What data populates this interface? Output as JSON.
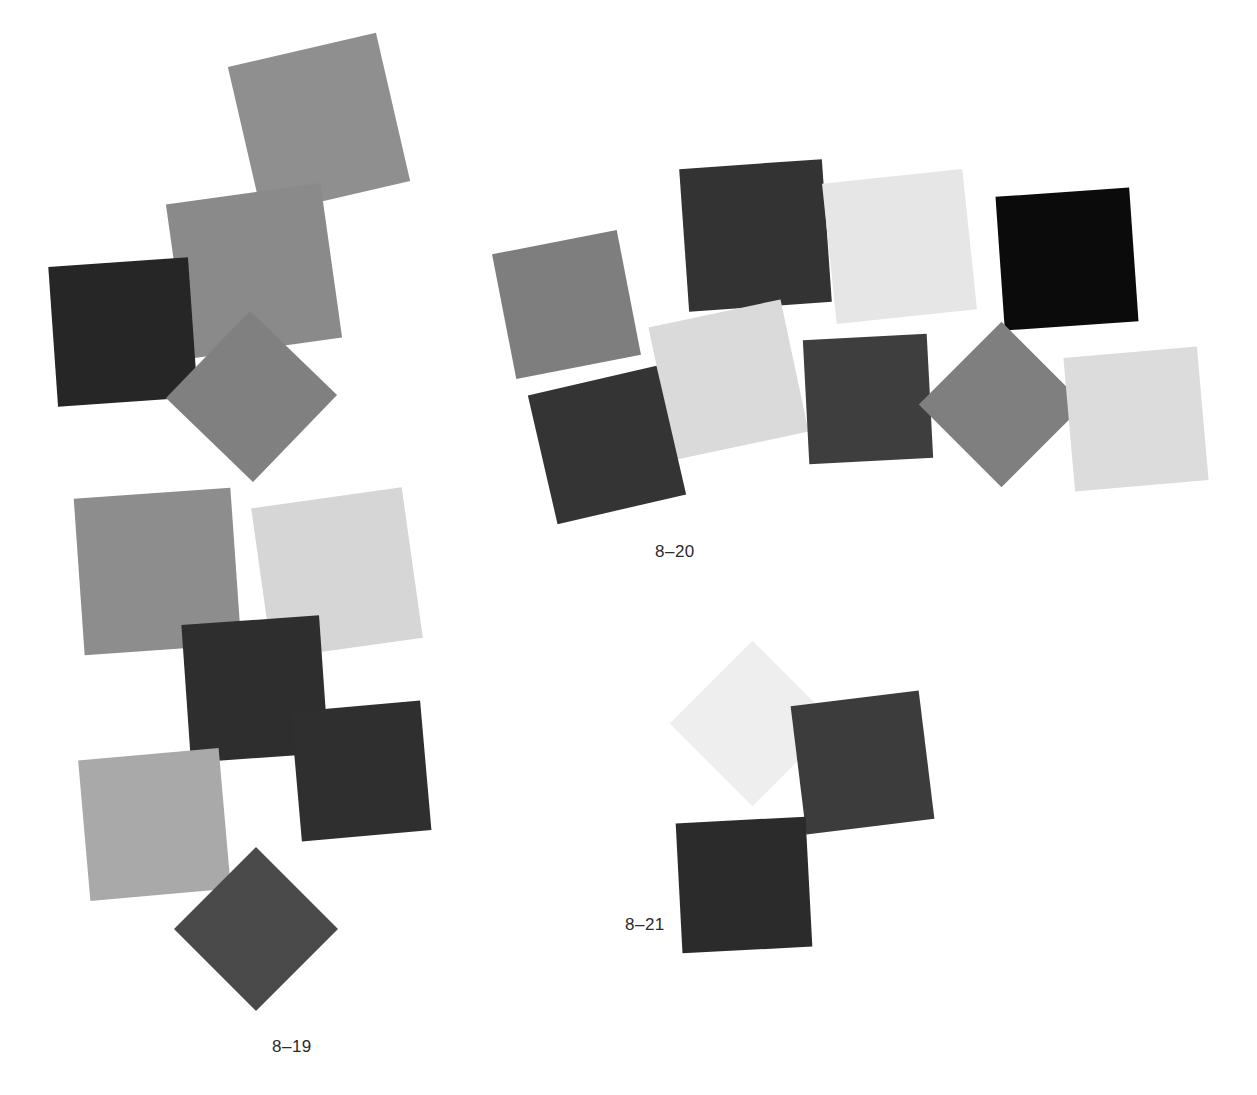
{
  "page": {
    "background_color": "#ffffff",
    "width": 1257,
    "height": 1095
  },
  "figures": [
    {
      "id": "fig-8-19",
      "label": "8–19",
      "label_x": 272,
      "label_y": 1038,
      "squares": [
        {
          "name": "square-gray-medium-top",
          "color": "#8f8f8f",
          "x": 243,
          "y": 48,
          "size": 152,
          "rotate": -13
        },
        {
          "name": "square-gray-medium-upper-left",
          "color": "#8a8a8a",
          "x": 176,
          "y": 193,
          "size": 156,
          "rotate": -8
        },
        {
          "name": "square-dark-left",
          "color": "#262626",
          "x": 53,
          "y": 262,
          "size": 140,
          "rotate": -4
        },
        {
          "name": "square-gray-diamond-mid",
          "color": "#808080",
          "x": 191,
          "y": 336,
          "size": 121,
          "rotate": 44
        },
        {
          "name": "square-gray-mid-left",
          "color": "#8d8d8d",
          "x": 79,
          "y": 493,
          "size": 157,
          "rotate": -4
        },
        {
          "name": "square-light-mid",
          "color": "#d6d6d6",
          "x": 261,
          "y": 497,
          "size": 152,
          "rotate": -8
        },
        {
          "name": "square-charcoal-upper",
          "color": "#2e2e2e",
          "x": 186,
          "y": 620,
          "size": 138,
          "rotate": -4
        },
        {
          "name": "square-charcoal-lower",
          "color": "#2f2f2f",
          "x": 296,
          "y": 706,
          "size": 130,
          "rotate": -5
        },
        {
          "name": "square-light-gray-bottom",
          "color": "#a9a9a9",
          "x": 84,
          "y": 754,
          "size": 141,
          "rotate": -5
        },
        {
          "name": "square-dark-diamond-bottom",
          "color": "#4a4a4a",
          "x": 198,
          "y": 871,
          "size": 116,
          "rotate": 45
        }
      ]
    },
    {
      "id": "fig-8-20",
      "label": "8–20",
      "label_x": 655,
      "label_y": 543,
      "squares": [
        {
          "name": "square-gray-left",
          "color": "#7e7e7e",
          "x": 503,
          "y": 241,
          "size": 127,
          "rotate": -11
        },
        {
          "name": "square-charcoal-top",
          "color": "#333333",
          "x": 684,
          "y": 164,
          "size": 143,
          "rotate": -4
        },
        {
          "name": "square-very-light-top",
          "color": "#e6e6e6",
          "x": 829,
          "y": 176,
          "size": 141,
          "rotate": -6
        },
        {
          "name": "square-black-top-right",
          "color": "#0b0b0b",
          "x": 1000,
          "y": 192,
          "size": 134,
          "rotate": -4
        },
        {
          "name": "square-light-center",
          "color": "#dadada",
          "x": 661,
          "y": 312,
          "size": 135,
          "rotate": -12
        },
        {
          "name": "square-charcoal-left-lower",
          "color": "#343434",
          "x": 541,
          "y": 379,
          "size": 132,
          "rotate": -13
        },
        {
          "name": "square-dark-gray-center",
          "color": "#3e3e3e",
          "x": 806,
          "y": 337,
          "size": 124,
          "rotate": -3
        },
        {
          "name": "square-gray-diamond-right",
          "color": "#7f7f7f",
          "x": 943,
          "y": 346,
          "size": 117,
          "rotate": 45
        },
        {
          "name": "square-light-right",
          "color": "#dcdcdc",
          "x": 1069,
          "y": 352,
          "size": 134,
          "rotate": -5
        }
      ]
    },
    {
      "id": "fig-8-21",
      "label": "8–21",
      "label_x": 625,
      "label_y": 916,
      "squares": [
        {
          "name": "square-very-light-diamond",
          "color": "#eeeeee",
          "x": 694,
          "y": 665,
          "size": 117,
          "rotate": 45
        },
        {
          "name": "square-dark-gray-right",
          "color": "#3c3c3c",
          "x": 798,
          "y": 698,
          "size": 129,
          "rotate": -7
        },
        {
          "name": "square-darkest-bottom",
          "color": "#2b2b2b",
          "x": 679,
          "y": 820,
          "size": 130,
          "rotate": -3
        }
      ]
    }
  ]
}
